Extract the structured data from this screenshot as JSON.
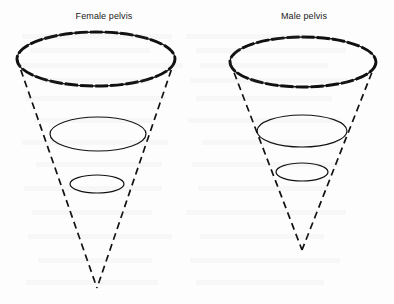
{
  "figure": {
    "background_color": "#fdfdfd",
    "ink_color": "#111111",
    "panels": [
      {
        "id": "female",
        "label": "Female pelvis",
        "label_x": 104,
        "label_y": 18,
        "inlet": {
          "name": "pelvic-inlet-ellipse",
          "cx": 96,
          "cy": 59,
          "rx": 79,
          "ry": 27,
          "stroke_style": "bold-dashed",
          "stroke_width": 2.6
        },
        "mid": {
          "name": "mid-pelvis-ellipse",
          "cx": 98,
          "cy": 134,
          "rx": 48,
          "ry": 17,
          "stroke_style": "solid",
          "stroke_width": 1.1
        },
        "outlet": {
          "name": "pelvic-outlet-ellipse",
          "cx": 97,
          "cy": 184,
          "rx": 27,
          "ry": 9,
          "stroke_style": "solid",
          "stroke_width": 1.1
        },
        "apex": {
          "x": 97,
          "y": 288
        },
        "side_left": {
          "x1": 17,
          "y1": 59,
          "x2": 97,
          "y2": 288
        },
        "side_right": {
          "x1": 175,
          "y1": 59,
          "x2": 97,
          "y2": 288
        },
        "stroke_style_sides": "dashed"
      },
      {
        "id": "male",
        "label": "Male pelvis",
        "label_x": 304,
        "label_y": 18,
        "inlet": {
          "name": "pelvic-inlet-ellipse",
          "cx": 303,
          "cy": 62,
          "rx": 73,
          "ry": 25,
          "stroke_style": "bold-dashed",
          "stroke_width": 2.6
        },
        "mid": {
          "name": "mid-pelvis-ellipse",
          "cx": 302,
          "cy": 131,
          "rx": 45,
          "ry": 16,
          "stroke_style": "solid",
          "stroke_width": 1.1
        },
        "outlet": {
          "name": "pelvic-outlet-ellipse",
          "cx": 302,
          "cy": 172,
          "rx": 26,
          "ry": 9,
          "stroke_style": "solid",
          "stroke_width": 1.1
        },
        "apex": {
          "x": 302,
          "y": 250
        },
        "side_left": {
          "x1": 230,
          "y1": 62,
          "x2": 302,
          "y2": 250
        },
        "side_right": {
          "x1": 376,
          "y1": 62,
          "x2": 302,
          "y2": 250
        },
        "stroke_style_sides": "dashed"
      }
    ]
  }
}
